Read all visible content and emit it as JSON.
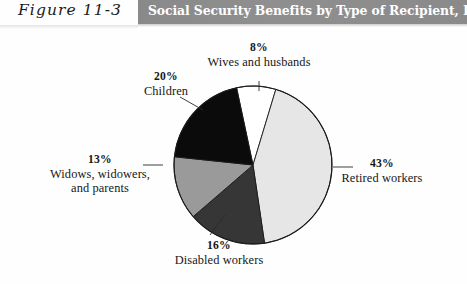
{
  "figure": {
    "number_label": "Figure 11-3",
    "banner_title": "Social Security Benefits by Type of Recipient, December 1998.",
    "banner_color": "#8d8d8d",
    "banner_text_color": "#ffffff",
    "background_color": "#fefefe"
  },
  "chart_data": {
    "type": "pie",
    "title": "Social Security Benefits by Type of Recipient, December 1998.",
    "xlabel": "",
    "ylabel": "",
    "units": "percent",
    "start_angle_deg": -12,
    "direction": "clockwise",
    "legend_position": "none",
    "grid": false,
    "labels_outside": true,
    "categories": [
      "Wives and husbands",
      "Retired workers",
      "Disabled workers",
      "Widows, widowers, and parents",
      "Children"
    ],
    "values": [
      8,
      43,
      16,
      13,
      20
    ],
    "value_labels": [
      "8%",
      "43%",
      "16%",
      "13%",
      "20%"
    ],
    "colors": [
      "#ffffff",
      "#e6e6e6",
      "#363636",
      "#9a9a9a",
      "#0b0b0b"
    ],
    "slice_border_color": "#1a1a1a",
    "slices": [
      {
        "name": "Wives and husbands",
        "value": 8,
        "pct_text": "8%",
        "label_line1": "Wives and husbands",
        "label_line2": "",
        "label_line3": "",
        "color": "#ffffff"
      },
      {
        "name": "Retired workers",
        "value": 43,
        "pct_text": "43%",
        "label_line1": "Retired workers",
        "label_line2": "",
        "label_line3": "",
        "color": "#e6e6e6"
      },
      {
        "name": "Disabled workers",
        "value": 16,
        "pct_text": "16%",
        "label_line1": "Disabled workers",
        "label_line2": "",
        "label_line3": "",
        "color": "#363636"
      },
      {
        "name": "Widows, widowers, and parents",
        "value": 13,
        "pct_text": "13%",
        "label_line1": "Widows, widowers,",
        "label_line2": "and parents",
        "label_line3": "",
        "color": "#9a9a9a"
      },
      {
        "name": "Children",
        "value": 20,
        "pct_text": "20%",
        "label_line1": "Children",
        "label_line2": "",
        "label_line3": "",
        "color": "#0b0b0b"
      }
    ]
  }
}
